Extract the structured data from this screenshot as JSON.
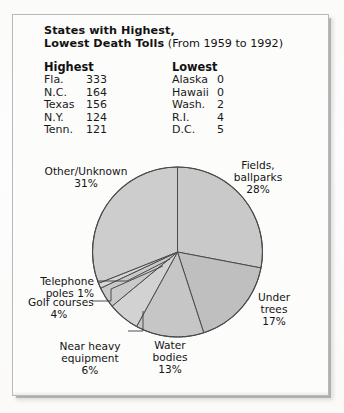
{
  "panel": {
    "title_bold": "States with Highest,\nLowest Death Tolls",
    "title_line1": "States with Highest,",
    "title_line2": "Lowest Death Tolls",
    "title_paren": " (From 1959 to 1992)"
  },
  "table": {
    "highest_header": "Highest",
    "lowest_header": "Lowest",
    "highest": [
      {
        "name": "Fla.",
        "value": "333"
      },
      {
        "name": "N.C.",
        "value": "164"
      },
      {
        "name": "Texas",
        "value": "156"
      },
      {
        "name": "N.Y.",
        "value": "124"
      },
      {
        "name": "Tenn.",
        "value": "121"
      }
    ],
    "lowest": [
      {
        "name": "Alaska",
        "value": "0"
      },
      {
        "name": "Hawaii",
        "value": "0"
      },
      {
        "name": "Wash.",
        "value": "2"
      },
      {
        "name": "R.I.",
        "value": "4"
      },
      {
        "name": "D.C.",
        "value": "5"
      }
    ]
  },
  "chart_data": {
    "type": "pie",
    "title": "States with Highest, Lowest Death Tolls (From 1959 to 1992)",
    "subtitle": "",
    "xlabel": "",
    "ylabel": "",
    "legend_position": "callout-labels",
    "grid": false,
    "start_angle_deg": 0,
    "direction": "clockwise",
    "units": "percent",
    "categories": [
      "Fields, ballparks",
      "Under trees",
      "Water bodies",
      "Near heavy equipment",
      "Golf courses",
      "Telephone poles",
      "Other/Unknown"
    ],
    "values": [
      28,
      17,
      13,
      6,
      4,
      1,
      31
    ],
    "slices": [
      {
        "label": "Fields, ballparks",
        "label_line1": "Fields,",
        "label_line2": "ballparks",
        "value": 28,
        "value_text": "28%",
        "color": "#c9c9c9"
      },
      {
        "label": "Under trees",
        "label_line1": "Under",
        "label_line2": "trees",
        "value": 17,
        "value_text": "17%",
        "color": "#bfbfbf"
      },
      {
        "label": "Water bodies",
        "label_line1": "Water",
        "label_line2": "bodies",
        "value": 13,
        "value_text": "13%",
        "color": "#c6c6c6"
      },
      {
        "label": "Near heavy equipment",
        "label_line1": "Near heavy",
        "label_line2": "equipment",
        "value": 6,
        "value_text": "6%",
        "color": "#d2d2d2"
      },
      {
        "label": "Golf courses",
        "label_line1": "Golf courses",
        "label_line2": "",
        "value": 4,
        "value_text": "4%",
        "color": "#c9c9c9"
      },
      {
        "label": "Telephone poles",
        "label_line1": "Telephone",
        "label_line2": "poles 1%",
        "value": 1,
        "value_text": "1%",
        "color": "#d6d6d6"
      },
      {
        "label": "Other/Unknown",
        "label_line1": "Other/Unknown",
        "label_line2": "",
        "value": 31,
        "value_text": "31%",
        "color": "#cdcdcd"
      }
    ]
  },
  "labels": {
    "other_unknown_name": "Other/Unknown",
    "other_unknown_pct": "31%",
    "fields_l1": "Fields,",
    "fields_l2": "ballparks",
    "fields_pct": "28%",
    "under_trees_l1": "Under",
    "under_trees_l2": "trees",
    "under_trees_pct": "17%",
    "water_l1": "Water",
    "water_l2": "bodies",
    "water_pct": "13%",
    "near_heavy_l1": "Near heavy",
    "near_heavy_l2": "equipment",
    "near_heavy_pct": "6%",
    "golf_l1": "Golf courses",
    "golf_pct": "4%",
    "telephone_l1": "Telephone",
    "telephone_l2": "poles 1%"
  },
  "style": {
    "slice_stroke": "#4a4a4a",
    "panel_border": "#b9b9b9",
    "text_color": "#141414"
  }
}
